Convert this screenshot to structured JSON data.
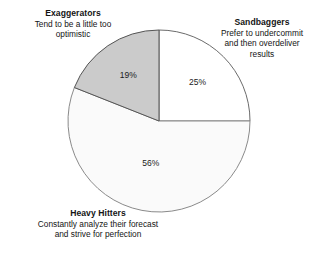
{
  "chart_data": {
    "type": "pie",
    "title": "",
    "subtitle": "",
    "xlabel": "",
    "ylabel": "",
    "legend_position": "callouts-around-pie",
    "grid": false,
    "categories": [
      "Sandbaggers",
      "Heavy Hitters",
      "Exaggerators"
    ],
    "values": [
      25,
      56,
      19
    ],
    "value_labels": [
      "25%",
      "56%",
      "19%"
    ],
    "slices": [
      {
        "name": "Sandbaggers",
        "value": 25,
        "label": "25%",
        "fill": "#ffffff",
        "stroke": "#6b6b6b",
        "start_angle_deg": 0,
        "end_angle_deg": 90
      },
      {
        "name": "Heavy Hitters",
        "value": 56,
        "label": "56%",
        "fill": "#fafafa",
        "stroke": "#8a8a8a",
        "start_angle_deg": 90,
        "end_angle_deg": 291.6
      },
      {
        "name": "Exaggerators",
        "value": 19,
        "label": "19%",
        "fill": "#cbcbcb",
        "stroke": "#555555",
        "start_angle_deg": 291.6,
        "end_angle_deg": 360
      }
    ],
    "annotations": [
      {
        "name": "Exaggerators",
        "title": "Exaggerators",
        "description": "Tend to be a little too\noptimistic"
      },
      {
        "name": "Sandbaggers",
        "title": "Sandbaggers",
        "description": "Prefer to undercommit\nand then overdeliver\nresults"
      },
      {
        "name": "Heavy Hitters",
        "title": "Heavy Hitters",
        "description": "Constantly analyze their forecast\nand strive for perfection"
      }
    ]
  },
  "geometry": {
    "center_x": 159,
    "center_y": 121,
    "radius": 91
  }
}
